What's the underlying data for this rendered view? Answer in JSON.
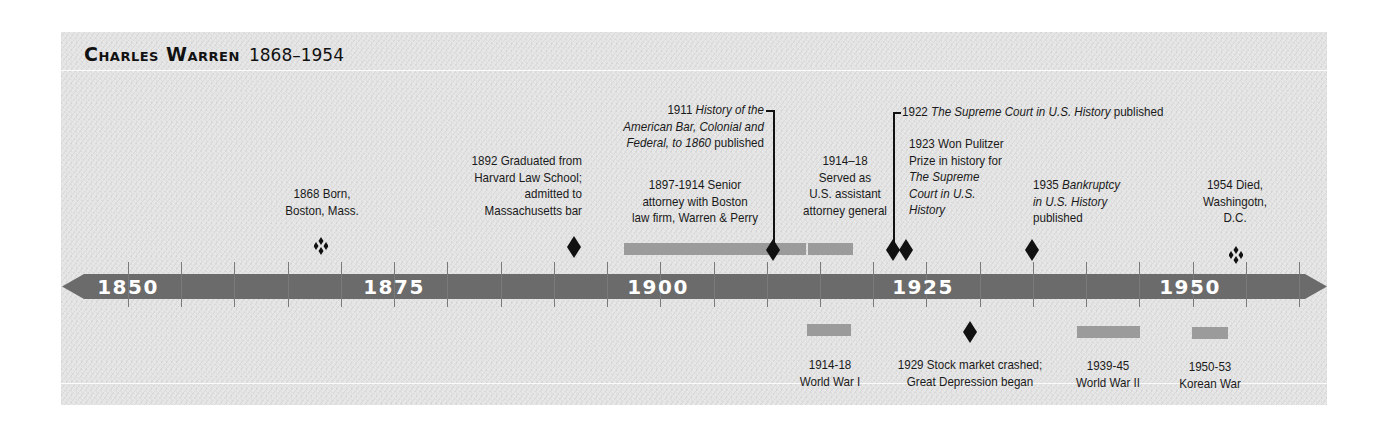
{
  "title": {
    "name": "Charles Warren",
    "years": "1868–1954"
  },
  "axis": {
    "start_year": 1850,
    "end_year": 1960,
    "tick_interval": 5,
    "labels": [
      "1850",
      "1875",
      "1900",
      "1925",
      "1950"
    ],
    "band_color": "#6b6b6b",
    "bar_color": "#9b9b9b",
    "marker_color": "#111111",
    "background_color": "#e4e4e4"
  },
  "events_above": [
    {
      "year": "1868",
      "text": "Born, Boston, Mass.",
      "line1": "1868 Born,",
      "line2": "Boston, Mass.",
      "marker": "ornament"
    },
    {
      "year": "1892",
      "line1": "1892 Graduated from",
      "line2": "Harvard Law School;",
      "line3": "admitted to",
      "line4": "Massachusetts bar",
      "marker": "diamond"
    },
    {
      "year": "1897-1914",
      "line1": "1897-1914 Senior",
      "line2": "attorney with Boston",
      "line3": "law firm, Warren & Perry",
      "marker": "bar"
    },
    {
      "year": "1911",
      "line1_year": "1911",
      "line1_italic": "History of the",
      "line2_italic": "American Bar, Colonial and",
      "line3_italic": "Federal, to 1860",
      "line3_plain": "published",
      "marker": "diamond-leader"
    },
    {
      "year": "1914–18",
      "line1": "1914–18",
      "line2": "Served as",
      "line3": "U.S. assistant",
      "line4": "attorney general",
      "marker": "bar"
    },
    {
      "year": "1922",
      "year_label": "1922",
      "italic": "The Supreme Court in U.S. History",
      "plain": "published",
      "marker": "diamond-leader"
    },
    {
      "year": "1923",
      "line1": "1923 Won Pulitzer",
      "line2": "Prize in history for",
      "line3_italic": "The Supreme",
      "line4_italic": "Court in U.S.",
      "line5_italic": "History",
      "marker": "diamond"
    },
    {
      "year": "1935",
      "line1_year": "1935",
      "line1_italic": "Bankruptcy",
      "line2_italic": "in U.S. History",
      "line3": "published",
      "marker": "diamond"
    },
    {
      "year": "1954",
      "line1": "1954 Died,",
      "line2": "Washingotn,",
      "line3": "D.C.",
      "marker": "ornament"
    }
  ],
  "events_below": [
    {
      "line1": "1914-18",
      "line2": "World War I",
      "marker": "bar"
    },
    {
      "line1": "1929 Stock market crashed;",
      "line2": "Great Depression began",
      "marker": "diamond"
    },
    {
      "line1": "1939-45",
      "line2": "World War II",
      "marker": "bar"
    },
    {
      "line1": "1950-53",
      "line2": "Korean War",
      "marker": "bar"
    }
  ]
}
